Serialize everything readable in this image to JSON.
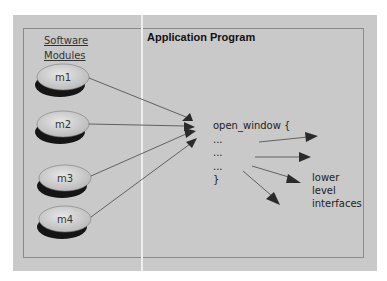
{
  "diagram": {
    "title": "Application Program",
    "modules_header": [
      "Software",
      "Modules"
    ],
    "modules": [
      {
        "label": "m1",
        "cx": 63,
        "cy": 77
      },
      {
        "label": "m2",
        "cx": 63,
        "cy": 124
      },
      {
        "label": "m3",
        "cx": 65,
        "cy": 178
      },
      {
        "label": "m4",
        "cx": 65,
        "cy": 219
      }
    ],
    "code_lines": [
      "open_window {",
      "...",
      "...",
      "...",
      "}"
    ],
    "target_label": [
      "lower",
      "level",
      "interfaces"
    ],
    "colors": {
      "panel": "#c9c9c9",
      "module_fill": "#d4d4d4",
      "module_shadow": "#1a1a1a",
      "arrow": "#4a4a4a"
    }
  }
}
